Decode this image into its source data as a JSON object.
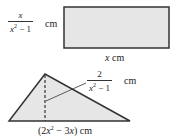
{
  "figure": {
    "rectangle": {
      "height_label": {
        "numerator": "x",
        "denominator_var": "x",
        "denominator_exp": "2",
        "denominator_rest": " − 1",
        "unit": "cm"
      },
      "width_label": {
        "var": "x",
        "unit": " cm"
      },
      "fill": "#e6e6e6",
      "stroke": "#333333"
    },
    "triangle": {
      "height_label": {
        "numerator": "2",
        "denominator_var": "x",
        "denominator_exp": "2",
        "denominator_rest": " − 1",
        "unit": "cm"
      },
      "base_label": {
        "open": "(2",
        "var": "x",
        "exp": "2",
        "mid": " − 3",
        "var2": "x",
        "close": ") cm"
      },
      "fill": "#e6e6e6",
      "stroke": "#333333"
    }
  }
}
